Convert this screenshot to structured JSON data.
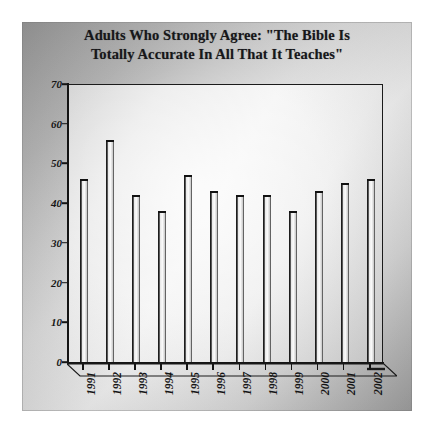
{
  "chart_data": {
    "type": "bar",
    "title": "Adults Who Strongly Agree: \"The Bible Is Totally Accurate In All That It Teaches\"",
    "title_line1": "Adults Who Strongly Agree: \"The Bible Is",
    "title_line2": "Totally Accurate In All That It Teaches\"",
    "categories": [
      "1991",
      "1992",
      "1993",
      "1994",
      "1995",
      "1996",
      "1997",
      "1998",
      "1999",
      "2000",
      "2001",
      "2002"
    ],
    "values": [
      46,
      56,
      42,
      38,
      47,
      43,
      42,
      42,
      38,
      43,
      45,
      46
    ],
    "xlabel": "",
    "ylabel": "",
    "ylim": [
      0,
      70
    ],
    "ytick_labels": [
      "0",
      "10",
      "20",
      "30",
      "40",
      "50",
      "60",
      "70"
    ],
    "ytick_values": [
      0,
      10,
      20,
      30,
      40,
      50,
      60,
      70
    ],
    "grid": false,
    "legend": false,
    "series_name": "Percent who strongly agree",
    "colors": {
      "bar_fill": "#f7f7f7",
      "bar_outline": "#121212",
      "axis": "#141414",
      "plot_background": "#ededed",
      "panel_background": "#b8b8b8",
      "text": "#17171a"
    }
  }
}
